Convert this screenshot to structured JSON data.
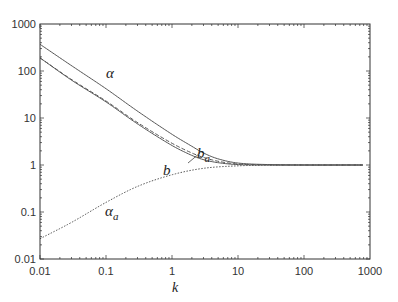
{
  "chart_data": {
    "type": "line",
    "title": "",
    "xlabel": "k",
    "ylabel": "",
    "xscale": "log",
    "yscale": "log",
    "xlim": [
      0.01,
      1000
    ],
    "ylim": [
      0.01,
      1000
    ],
    "grid": false,
    "legend": "none (inline curve labels)",
    "x_tick_labels": [
      "0.01",
      "0.1",
      "1",
      "10",
      "100",
      "1000"
    ],
    "y_tick_labels": [
      "0.01",
      "0.1",
      "1",
      "10",
      "100",
      "1000"
    ],
    "series": [
      {
        "name": "α",
        "style": "solid",
        "label_pos": {
          "k": 0.15,
          "v": 90
        },
        "points": [
          [
            0.01,
            370
          ],
          [
            0.03,
            130
          ],
          [
            0.1,
            42
          ],
          [
            0.3,
            14
          ],
          [
            1,
            4.5
          ],
          [
            2,
            2.5
          ],
          [
            3,
            1.8
          ],
          [
            5,
            1.35
          ],
          [
            10,
            1.1
          ],
          [
            30,
            1.02
          ],
          [
            100,
            1.0
          ],
          [
            780,
            1.0
          ]
        ]
      },
      {
        "name": "b_a",
        "style": "dashed",
        "label_pos": {
          "k": 2.2,
          "v": 3.0
        },
        "points": [
          [
            0.01,
            190
          ],
          [
            0.03,
            66
          ],
          [
            0.1,
            23
          ],
          [
            0.3,
            8
          ],
          [
            1,
            2.9
          ],
          [
            2,
            1.8
          ],
          [
            3,
            1.45
          ],
          [
            5,
            1.2
          ],
          [
            10,
            1.05
          ],
          [
            30,
            1.01
          ],
          [
            100,
            1.0
          ],
          [
            780,
            1.0
          ]
        ]
      },
      {
        "name": "b",
        "style": "solid",
        "label_pos": {
          "k": 0.9,
          "v": 1.15
        },
        "points": [
          [
            0.01,
            190
          ],
          [
            0.03,
            64
          ],
          [
            0.1,
            22
          ],
          [
            0.3,
            7.5
          ],
          [
            1,
            2.6
          ],
          [
            2,
            1.6
          ],
          [
            3,
            1.3
          ],
          [
            5,
            1.12
          ],
          [
            10,
            1.02
          ],
          [
            30,
            1.0
          ],
          [
            100,
            1.0
          ],
          [
            780,
            1.0
          ]
        ]
      },
      {
        "name": "α_a",
        "style": "dotted",
        "label_pos": {
          "k": 0.12,
          "v": 0.085
        },
        "points": [
          [
            0.01,
            0.027
          ],
          [
            0.03,
            0.06
          ],
          [
            0.1,
            0.16
          ],
          [
            0.3,
            0.35
          ],
          [
            1,
            0.62
          ],
          [
            3,
            0.85
          ],
          [
            10,
            0.96
          ],
          [
            30,
            0.99
          ],
          [
            100,
            1.0
          ],
          [
            780,
            1.0
          ]
        ]
      }
    ]
  },
  "labels": {
    "alpha": "α",
    "b_a_main": "b",
    "b_a_sub": "a",
    "b": "b",
    "alpha_a_main": "α",
    "alpha_a_sub": "a",
    "xlabel": "k"
  }
}
